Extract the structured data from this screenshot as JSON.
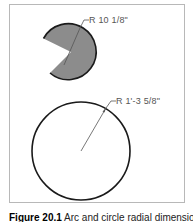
{
  "figure": {
    "arc_dimension": {
      "label": "R 10 1/8\"",
      "shape": "arc-sector",
      "fill_color": "#8c8c8c",
      "stroke_color": "#1a1a1a"
    },
    "circle_dimension": {
      "label": "R 1'-3 5/8\"",
      "shape": "circle",
      "stroke_color": "#1a1a1a"
    },
    "leader_color": "#555555",
    "frame_color": "#b8b8b8"
  },
  "caption": {
    "number": "Figure 20.1",
    "text": " Arc and circle radial dimensions"
  }
}
